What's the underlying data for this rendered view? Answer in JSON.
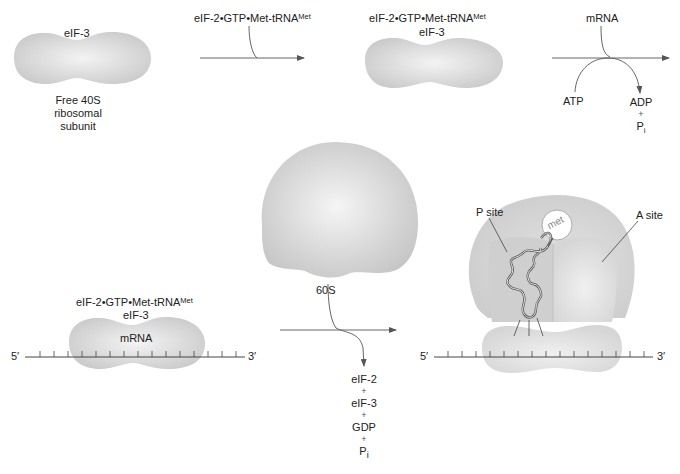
{
  "figure": {
    "steps": [
      {
        "id": "free-40s",
        "factor_label": "eIF-3",
        "caption_lines": [
          "Free 40S",
          "ribosomal",
          "subunit"
        ]
      },
      {
        "id": "arrow-1",
        "input_label": "eIF-2•GTP•Met-tRNA",
        "input_sup": "Met"
      },
      {
        "id": "43s-complex",
        "label_line1": "eIF-2•GTP•Met-tRNA",
        "label_line1_sup": "Met",
        "label_line2": "eIF-3"
      },
      {
        "id": "arrow-2",
        "input_label": "mRNA",
        "consumed": "ATP",
        "products": [
          "ADP",
          "+",
          "P",
          "i"
        ]
      },
      {
        "id": "48s-complex",
        "label_line1": "eIF-2•GTP•Met-tRNA",
        "label_line1_sup": "Met",
        "label_line2": "eIF-3",
        "inner_label": "mRNA",
        "five_prime": "5′",
        "three_prime": "3′"
      },
      {
        "id": "60s-subunit",
        "label": "60S"
      },
      {
        "id": "arrow-3",
        "released": [
          "eIF-2",
          "+",
          "eIF-3",
          "+",
          "GDP",
          "+"
        ],
        "released_last": "P",
        "released_last_sub": "i"
      },
      {
        "id": "80s-complex",
        "p_site_label": "P site",
        "a_site_label": "A site",
        "met_label": "met",
        "five_prime": "5′",
        "three_prime": "3′"
      }
    ]
  },
  "colors": {
    "subunit_fill": "#d4d4d4",
    "subunit_highlight": "#f2f2f2",
    "line": "#444444",
    "text": "#222222"
  }
}
